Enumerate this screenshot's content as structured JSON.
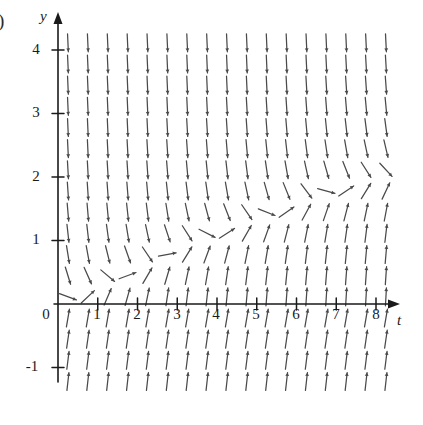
{
  "figure": {
    "label": ")",
    "type": "direction-field",
    "line_color": "#4a4a4a",
    "axis_color": "#1a1a1a",
    "background": "#ffffff"
  },
  "axes": {
    "x_label": "t",
    "y_label": "y",
    "x_ticks": [
      "1",
      "2",
      "3",
      "4",
      "5",
      "6",
      "7",
      "8"
    ],
    "y_ticks": [
      "4",
      "3",
      "2",
      "1",
      "0",
      "-1"
    ],
    "origin_label": "0",
    "x_range": [
      0,
      8.4
    ],
    "y_range": [
      -1.3,
      4.3
    ]
  },
  "chart_data": {
    "type": "scatter",
    "title": "",
    "xlabel": "t",
    "ylabel": "y",
    "xlim": [
      0,
      8.4
    ],
    "ylim": [
      -1.3,
      4.3
    ],
    "grid": false,
    "legend": "none",
    "nullcline": {
      "t": [
        0.8,
        1.5,
        2.0,
        2.5,
        3.0,
        3.5,
        4.0,
        4.5,
        5.0,
        5.5,
        6.0,
        6.5,
        7.0,
        7.5,
        8.0
      ],
      "y": [
        0.25,
        0.42,
        0.55,
        0.7,
        0.9,
        1.0,
        1.12,
        1.24,
        1.35,
        1.46,
        1.58,
        1.7,
        1.8,
        1.9,
        2.0
      ]
    },
    "lattice": {
      "t_start": 0.25,
      "t_step": 0.5,
      "t_count": 17,
      "y_start": -1.22,
      "y_step": 0.3333,
      "y_count": 17
    }
  }
}
